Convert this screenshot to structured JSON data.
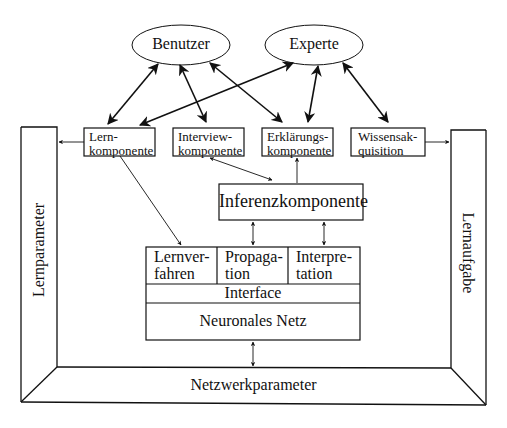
{
  "diagram": {
    "actors": {
      "benutzer": "Benutzer",
      "experte": "Experte"
    },
    "components": {
      "lern": {
        "line1": "Lern-",
        "line2": "komponente"
      },
      "interview": {
        "line1": "Interview-",
        "line2": "komponente"
      },
      "erklaerung": {
        "line1": "Erklärungs-",
        "line2": "komponente"
      },
      "wissen": {
        "line1": "Wissensak-",
        "line2": "quisition"
      },
      "inferenz": "Inferenzkomponente"
    },
    "core": {
      "lernverfahren": {
        "line1": "Lernver-",
        "line2": "fahren"
      },
      "propagation": {
        "line1": "Propaga-",
        "line2": "tion"
      },
      "interpretation": {
        "line1": "Interpre-",
        "line2": "tation"
      },
      "interface": "Interface",
      "netz": "Neuronales Netz"
    },
    "frame": {
      "left": "Lernparameter",
      "right": "Lernaufgabe",
      "bottom": "Netzwerkparameter"
    }
  },
  "colors": {
    "line": "#111111",
    "background": "#ffffff"
  }
}
